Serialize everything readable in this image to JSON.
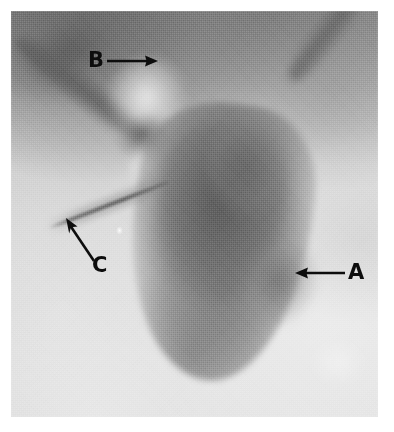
{
  "figure": {
    "kind": "radiograph-photomicrograph-plate",
    "modality_appearance": "grayscale halftone-printed radiographic plate",
    "background_color": "#ffffff",
    "plate_color": "#c9c9c9",
    "annotation_color": "#0d0d0d",
    "plate": {
      "x": 11,
      "y": 11,
      "width": 367,
      "height": 406
    }
  },
  "annotations": [
    {
      "id": "annotation-a",
      "label": "A",
      "icon": "left-arrow-icon",
      "direction": "left",
      "label_x": 348,
      "label_y": 262,
      "arrow_x": 294,
      "arrow_y": 264,
      "arrow_width": 52,
      "arrow_height": 20,
      "points_to": "right margin of the opacified viscus"
    },
    {
      "id": "annotation-b",
      "label": "B",
      "icon": "right-arrow-icon",
      "direction": "right",
      "label_x": 88,
      "label_y": 50,
      "arrow_x": 104,
      "arrow_y": 52,
      "arrow_width": 54,
      "arrow_height": 20,
      "points_to": "upper ductal branch / hilar region"
    },
    {
      "id": "annotation-c",
      "label": "C",
      "icon": "diagonal-arrow-up-left-icon",
      "direction": "up-left",
      "label_x": 92,
      "label_y": 255,
      "arrow_x": 60,
      "arrow_y": 214,
      "arrow_width": 40,
      "arrow_height": 52,
      "points_to": "thin linear catheter / duct tracking inferolaterally"
    }
  ]
}
